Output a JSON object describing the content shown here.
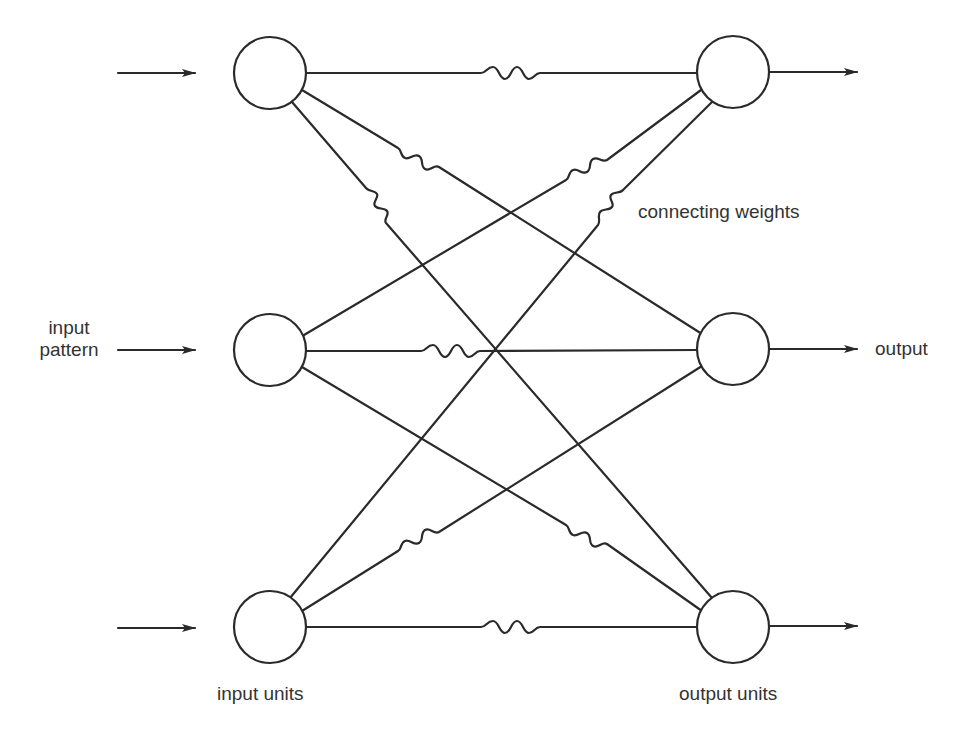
{
  "diagram": {
    "type": "pattern-associator network",
    "stroke_color": "#2a2a2a",
    "background": "#ffffff",
    "input_units": [
      {
        "id": "in1",
        "cx": 270,
        "cy": 73,
        "r": 36
      },
      {
        "id": "in2",
        "cx": 270,
        "cy": 350,
        "r": 36
      },
      {
        "id": "in3",
        "cx": 270,
        "cy": 627,
        "r": 36
      }
    ],
    "output_units": [
      {
        "id": "out1",
        "cx": 733,
        "cy": 73,
        "r": 36
      },
      {
        "id": "out2",
        "cx": 733,
        "cy": 350,
        "r": 36
      },
      {
        "id": "out3",
        "cx": 733,
        "cy": 627,
        "r": 36
      }
    ],
    "connections": [
      {
        "from": "in1",
        "to": "out1"
      },
      {
        "from": "in1",
        "to": "out2"
      },
      {
        "from": "in1",
        "to": "out3"
      },
      {
        "from": "in2",
        "to": "out1"
      },
      {
        "from": "in2",
        "to": "out2"
      },
      {
        "from": "in2",
        "to": "out3"
      },
      {
        "from": "in3",
        "to": "out1"
      },
      {
        "from": "in3",
        "to": "out2"
      },
      {
        "from": "in3",
        "to": "out3"
      }
    ],
    "labels": {
      "input_pattern_line1": "input",
      "input_pattern_line2": "pattern",
      "output": "output",
      "connecting_weights": "connecting weights",
      "input_units": "input units",
      "output_units": "output units"
    }
  }
}
